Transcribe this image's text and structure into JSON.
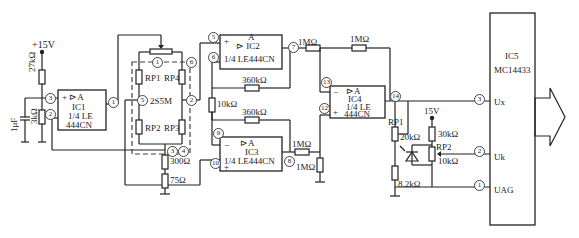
{
  "supply": {
    "v15_left": "+15V",
    "v15_right": "15V"
  },
  "resistors": {
    "r27k": "27kΩ",
    "r3k": "3kΩ",
    "c1u": "1μF",
    "r300": "300Ω",
    "r75": "75Ω",
    "r10k": "10kΩ",
    "r360k_a": "360kΩ",
    "r360k_b": "360kΩ",
    "r1M_a": "1MΩ",
    "r1M_b": "1MΩ",
    "r1M_c": "1MΩ",
    "r1M_d": "1MΩ",
    "rp1": "RP1",
    "rp1_val": "20kΩ",
    "r8k2": "8.2kΩ",
    "r30k": "30kΩ",
    "rp2": "RP2",
    "rp2_val": "10kΩ"
  },
  "sensor": {
    "name": "2S5M",
    "rp1": "RP1",
    "rp2": "RP2",
    "rp3": "RP3",
    "rp4": "RP4"
  },
  "ic1": {
    "sym": "+ ⊳A",
    "name": "IC1",
    "part1": "1/4 LE",
    "part2": "444CN",
    "minus": "−"
  },
  "ic2": {
    "sym": "⊳ IC2",
    "a": "A",
    "part": "1/4 LE444CN",
    "plus": "+",
    "minus": "−"
  },
  "ic3": {
    "sym": "⊳A",
    "name": "IC3",
    "part": "1/4 LE444CN",
    "plus": "+",
    "minus": "−"
  },
  "ic4": {
    "sym": "⊳A",
    "name": "IC4",
    "part1": "1/4 LE",
    "part2": "444CN",
    "plus": "+",
    "minus": "−"
  },
  "ic5": {
    "name": "IC5",
    "part": "MC14433",
    "ux": "Ux",
    "uk": "Uk",
    "uag": "UAG"
  },
  "pins": {
    "p1": "1",
    "p2": "2",
    "p3": "3",
    "p4": "4",
    "p5": "5",
    "p6": "6",
    "p7": "7",
    "p8": "8",
    "p9": "9",
    "p10": "10",
    "p12": "12",
    "p13": "13",
    "p14": "14"
  },
  "display": {
    "digits": [
      "1",
      "8",
      "8",
      "8"
    ],
    "decimal_after": 2
  }
}
